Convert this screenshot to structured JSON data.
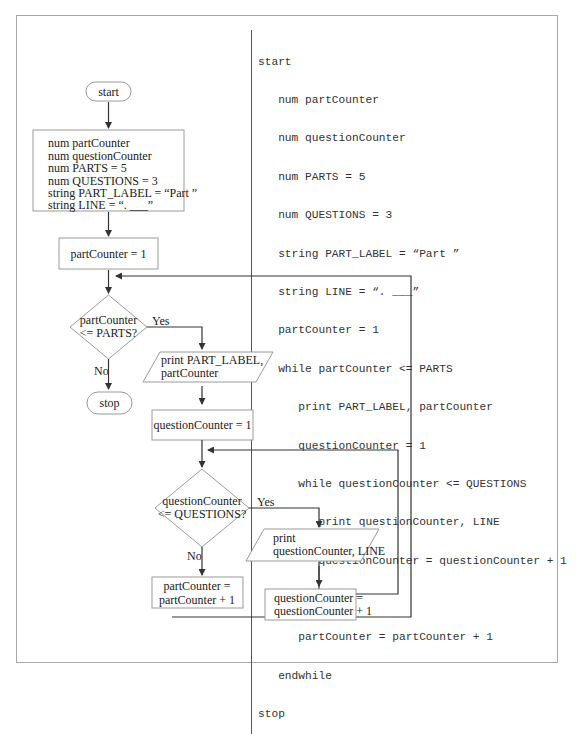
{
  "pseudocode": {
    "lines": [
      {
        "indent": 0,
        "text": "start"
      },
      {
        "indent": 1,
        "text": "num partCounter"
      },
      {
        "indent": 1,
        "text": "num questionCounter"
      },
      {
        "indent": 1,
        "text": "num PARTS = 5"
      },
      {
        "indent": 1,
        "text": "num QUESTIONS = 3"
      },
      {
        "indent": 1,
        "text": "string PART_LABEL = “Part ”"
      },
      {
        "indent": 1,
        "text": "string LINE = “. ___”"
      },
      {
        "indent": 1,
        "text": "partCounter = 1"
      },
      {
        "indent": 1,
        "text": "while partCounter <= PARTS"
      },
      {
        "indent": 2,
        "text": "print PART_LABEL, partCounter"
      },
      {
        "indent": 2,
        "text": "questionCounter = 1"
      },
      {
        "indent": 2,
        "text": "while questionCounter <= QUESTIONS"
      },
      {
        "indent": 3,
        "text": "print questionCounter, LINE"
      },
      {
        "indent": 3,
        "text": "questionCounter = questionCounter + 1"
      },
      {
        "indent": 2,
        "text": "endwhile"
      },
      {
        "indent": 2,
        "text": "partCounter = partCounter + 1"
      },
      {
        "indent": 1,
        "text": "endwhile"
      },
      {
        "indent": 0,
        "text": "stop"
      }
    ]
  },
  "flowchart": {
    "start": "start",
    "declarations": [
      "num partCounter",
      "num questionCounter",
      "num PARTS = 5",
      "num QUESTIONS = 3",
      "string PART_LABEL = “Part ”",
      "string LINE = “. ___”"
    ],
    "init_part": "partCounter = 1",
    "decision_part": [
      "partCounter",
      "<= PARTS?"
    ],
    "yes_label": "Yes",
    "no_label": "No",
    "stop": "stop",
    "print_part": [
      "print PART_LABEL,",
      "partCounter"
    ],
    "init_question": "questionCounter = 1",
    "decision_question": [
      "questionCounter",
      "<= QUESTIONS?"
    ],
    "print_question": [
      "print",
      "questionCounter, LINE"
    ],
    "increment_part": [
      "partCounter =",
      "partCounter + 1"
    ],
    "increment_question": [
      "questionCounter =",
      "questionCounter + 1"
    ]
  }
}
